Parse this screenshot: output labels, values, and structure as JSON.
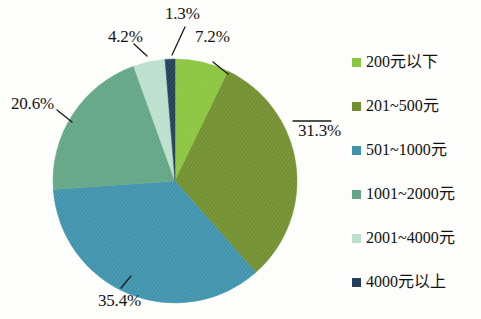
{
  "chart_data": {
    "type": "pie",
    "title": "",
    "subtitle": "",
    "xlabel": "",
    "ylabel": "",
    "grid": false,
    "legend_position": "right",
    "units": "percent",
    "categories": [
      "200元以下",
      "201~500元",
      "501~1000元",
      "1001~2000元",
      "2001~4000元",
      "4000元以上"
    ],
    "values": [
      7.2,
      31.3,
      35.4,
      20.6,
      4.2,
      1.3
    ],
    "data_labels": [
      "7.2%",
      "31.3%",
      "35.4%",
      "20.6%",
      "4.2%",
      "1.3%"
    ],
    "colors": [
      "#8CC63F",
      "#72902F",
      "#3F93AD",
      "#63A686",
      "#BCDFCE",
      "#22405A"
    ],
    "slices": [
      {
        "label": "200元以下",
        "value": 7.2,
        "display": "7.2%",
        "color": "#8CC63F",
        "start_angle_deg": 0,
        "end_angle_deg": 25.92
      },
      {
        "label": "201~500元",
        "value": 31.3,
        "display": "31.3%",
        "color": "#72902F",
        "start_angle_deg": 25.92,
        "end_angle_deg": 138.6
      },
      {
        "label": "501~1000元",
        "value": 35.4,
        "display": "35.4%",
        "color": "#3F93AD",
        "start_angle_deg": 138.6,
        "end_angle_deg": 266.04
      },
      {
        "label": "1001~2000元",
        "value": 20.6,
        "display": "20.6%",
        "color": "#63A686",
        "start_angle_deg": 266.04,
        "end_angle_deg": 340.2
      },
      {
        "label": "2001~4000元",
        "value": 4.2,
        "display": "4.2%",
        "color": "#BCDFCE",
        "start_angle_deg": 340.2,
        "end_angle_deg": 355.32
      },
      {
        "label": "4000元以上",
        "value": 1.3,
        "display": "1.3%",
        "color": "#22405A",
        "start_angle_deg": 355.32,
        "end_angle_deg": 360
      }
    ]
  },
  "labels": {
    "l0": "7.2%",
    "l1": "31.3%",
    "l2": "35.4%",
    "l3": "20.6%",
    "l4": "4.2%",
    "l5": "1.3%"
  },
  "legend": {
    "items": [
      {
        "label": "200元以下",
        "color": "#8CC63F"
      },
      {
        "label": "201~500元",
        "color": "#72902F"
      },
      {
        "label": "501~1000元",
        "color": "#3F93AD"
      },
      {
        "label": "1001~2000元",
        "color": "#63A686"
      },
      {
        "label": "2001~4000元",
        "color": "#BCDFCE"
      },
      {
        "label": "4000元以上",
        "color": "#22405A"
      }
    ]
  }
}
